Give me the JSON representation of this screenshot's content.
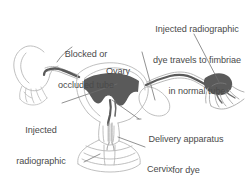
{
  "figure": {
    "background_color": "#ffffff",
    "text_color": "#4a4a4a",
    "outline_color": "#b8b8b8",
    "dye_color": "#5a5a5a",
    "leader_line_color": "#6e6e6e",
    "width": 250,
    "height": 182
  },
  "labels": {
    "blocked_tube": {
      "name": "blocked-or-occluded-tube",
      "line1": "Blocked or",
      "line2": "occluded tube"
    },
    "fimbriae_dye": {
      "name": "injected-dye-travels-to-fimbriae",
      "line1": "Injected radiographic",
      "line2": "dye travels to fimbriae",
      "line3": "in normal tube"
    },
    "ovary": {
      "name": "ovary",
      "line1": "Ovary"
    },
    "injected_dye": {
      "name": "injected-radiographic-dye",
      "line1": "Injected",
      "line2": "radiographic",
      "line3": "dye"
    },
    "delivery_apparatus": {
      "name": "delivery-apparatus-for-dye",
      "line1": "Delivery apparatus",
      "line2": "for dye"
    },
    "cervix": {
      "name": "cervix",
      "line1": "Cervix"
    },
    "vaginal_canal": {
      "name": "vaginal-canal",
      "line1": "Vaginal canal"
    }
  },
  "anatomy": {
    "parts": [
      {
        "id": "left-fimbriae",
        "label": "Left fimbriae",
        "dye_filled": false
      },
      {
        "id": "left-ovary",
        "label": "Left ovary",
        "dye_filled": false
      },
      {
        "id": "left-tube",
        "label": "Left fallopian tube (occluded)",
        "dye_filled": true
      },
      {
        "id": "uterus-cavity",
        "label": "Uterine cavity",
        "dye_filled": true
      },
      {
        "id": "right-tube",
        "label": "Right fallopian tube (patent)",
        "dye_filled": true
      },
      {
        "id": "right-ovary",
        "label": "Right ovary",
        "dye_filled": false
      },
      {
        "id": "right-fimbriae",
        "label": "Right fimbriae",
        "dye_filled": true
      },
      {
        "id": "cervix-body",
        "label": "Cervix",
        "dye_filled": false
      },
      {
        "id": "vagina",
        "label": "Vaginal canal",
        "dye_filled": false
      },
      {
        "id": "catheter",
        "label": "Delivery apparatus / catheter",
        "dye_filled": false
      }
    ]
  }
}
